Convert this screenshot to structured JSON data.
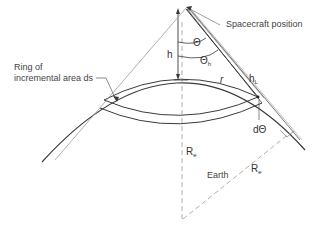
{
  "diagram": {
    "labels": {
      "spacecraft": "Spacecraft position",
      "ring_line1": "Ring of",
      "ring_line2": "incremental area ds",
      "earth": "Earth",
      "h": "h",
      "r": "r",
      "theta": "Θ",
      "theta_h_main": "Θ",
      "theta_h_sub": "h",
      "h_L_main": "h",
      "h_L_sub": "L",
      "d_theta": "dΘ",
      "R_e_vertical_main": "R",
      "R_e_vertical_sub": "e",
      "R_e_diag_main": "R",
      "R_e_diag_sub": "e"
    },
    "colors": {
      "line": "#3a3a3a",
      "light_line": "#888888",
      "dashed": "#9a9a9a",
      "text": "#444444"
    }
  }
}
